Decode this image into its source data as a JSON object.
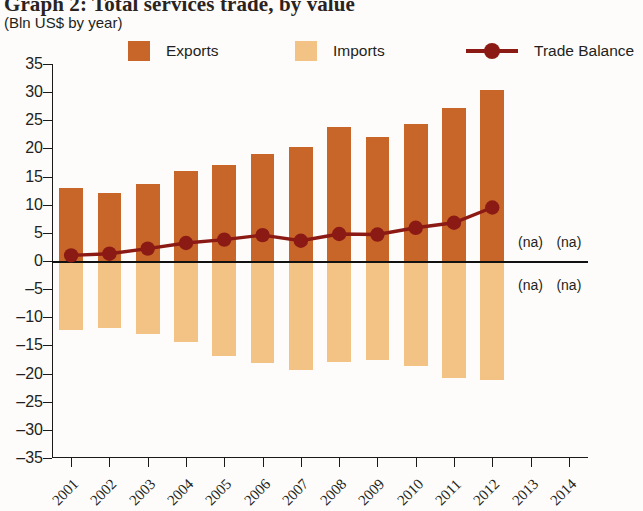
{
  "header": {
    "title": "Graph 2: Total services trade, by value",
    "subtitle": "(Bln US$ by year)"
  },
  "legend": {
    "items": [
      {
        "label": "Exports",
        "marker": "swatch",
        "color": "#c8662a"
      },
      {
        "label": "Imports",
        "marker": "swatch",
        "color": "#f2c385"
      },
      {
        "label": "Trade Balance",
        "marker": "line-dot",
        "color": "#8c1a14"
      }
    ]
  },
  "annotations": {
    "na_label": "(na)",
    "na_cells": [
      {
        "year": "2013",
        "side": "above"
      },
      {
        "year": "2014",
        "side": "above"
      },
      {
        "year": "2013",
        "side": "below"
      },
      {
        "year": "2014",
        "side": "below"
      }
    ]
  },
  "chart_data": {
    "type": "bar",
    "title": "Graph 2: Total services trade, by value",
    "subtitle": "(Bln US$ by year)",
    "xlabel": "",
    "ylabel": "",
    "ylim": [
      -35,
      35
    ],
    "yticks": [
      35,
      30,
      25,
      20,
      15,
      10,
      5,
      0,
      -5,
      -10,
      -15,
      -20,
      -25,
      -30,
      -35
    ],
    "ytick_labels": [
      "35",
      "30",
      "25",
      "20",
      "15",
      "10",
      "5",
      "0",
      "–5",
      "–10",
      "–15",
      "–20",
      "–25",
      "–30",
      "–35"
    ],
    "grid": false,
    "legend_position": "top",
    "categories": [
      "2001",
      "2002",
      "2003",
      "2004",
      "2005",
      "2006",
      "2007",
      "2008",
      "2009",
      "2010",
      "2011",
      "2012",
      "2013",
      "2014"
    ],
    "series": [
      {
        "name": "Exports",
        "type": "bar",
        "color": "#c8662a",
        "values": [
          13.0,
          12.1,
          13.6,
          16.0,
          17.1,
          19.0,
          20.3,
          23.8,
          22.1,
          24.3,
          27.1,
          30.4,
          null,
          null
        ]
      },
      {
        "name": "Imports",
        "type": "bar",
        "color": "#f2c385",
        "values": [
          -12.3,
          -11.9,
          -13.0,
          -14.4,
          -16.8,
          -18.2,
          -19.4,
          -18.0,
          -17.6,
          -18.6,
          -20.8,
          -21.1,
          null,
          null
        ]
      },
      {
        "name": "Trade Balance",
        "type": "line",
        "color": "#8c1a14",
        "values": [
          1.0,
          1.3,
          2.2,
          3.2,
          3.8,
          4.6,
          3.6,
          4.8,
          4.7,
          5.9,
          6.8,
          9.5,
          null,
          null
        ]
      }
    ]
  }
}
